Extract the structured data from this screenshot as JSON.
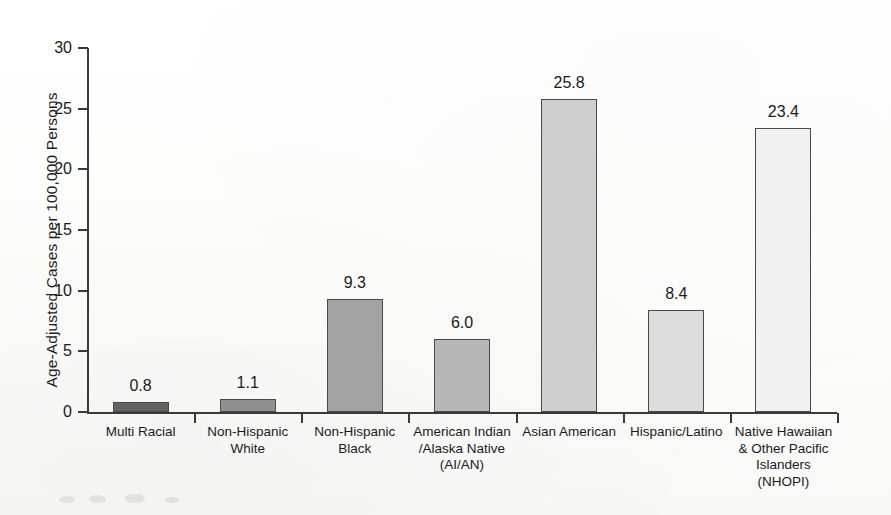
{
  "chart_data": {
    "type": "bar",
    "title": "",
    "xlabel": "",
    "ylabel": "Age-Adjusted Cases per 100,000 Persons",
    "ylim": [
      0,
      30
    ],
    "ytick_labels": [
      "30",
      "25",
      "20",
      "15",
      "10",
      "5",
      "0"
    ],
    "ytick_values": [
      30,
      25,
      20,
      15,
      10,
      5,
      0
    ],
    "grid": false,
    "legend": "none",
    "categories": [
      "Multi Racial",
      "Non-Hispanic White",
      "Non-Hispanic Black",
      "American Indian /Alaska Native (AI/AN)",
      "Asian American",
      "Hispanic/Latino",
      "Native Hawaiian & Other Pacific Islanders (NHOPI)"
    ],
    "category_lines": [
      [
        "Multi Racial"
      ],
      [
        "Non-Hispanic",
        "White"
      ],
      [
        "Non-Hispanic",
        "Black"
      ],
      [
        "American Indian",
        "/Alaska Native",
        "(AI/AN)"
      ],
      [
        "Asian American"
      ],
      [
        "Hispanic/Latino"
      ],
      [
        "Native Hawaiian",
        "& Other Pacific",
        "Islanders",
        "(NHOPI)"
      ]
    ],
    "values": [
      0.8,
      1.1,
      9.3,
      6.0,
      25.8,
      8.4,
      23.4
    ],
    "value_labels": [
      "0.8",
      "1.1",
      "9.3",
      "6.0",
      "25.8",
      "8.4",
      "23.4"
    ],
    "bar_colors": [
      "#636363",
      "#8f8f8f",
      "#a3a3a3",
      "#b7b7b7",
      "#cfcfcf",
      "#dcdcdc",
      "#f1f1f1"
    ],
    "bar_border_color": "#4a4a4a",
    "axis_color": "#3a3a3a",
    "text_color": "#1b1b1b"
  }
}
